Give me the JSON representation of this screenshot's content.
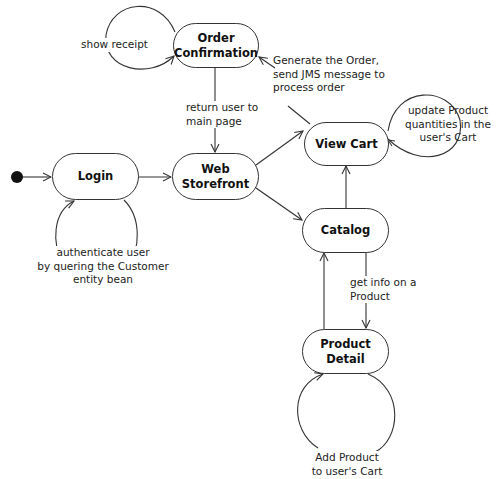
{
  "diagram": {
    "type": "UML state diagram",
    "states": [
      {
        "id": "login",
        "label": "Login"
      },
      {
        "id": "web_storefront",
        "label": "Web\nStorefront"
      },
      {
        "id": "order_confirmation",
        "label": "Order\nConfirmation"
      },
      {
        "id": "view_cart",
        "label": "View Cart"
      },
      {
        "id": "catalog",
        "label": "Catalog"
      },
      {
        "id": "product_detail",
        "label": "Product Detail"
      }
    ],
    "transitions": [
      {
        "from": "initial",
        "to": "login",
        "label": ""
      },
      {
        "from": "login",
        "to": "login",
        "label": "authenticate user\nby quering the Customer\nentity bean"
      },
      {
        "from": "login",
        "to": "web_storefront",
        "label": ""
      },
      {
        "from": "order_confirmation",
        "to": "order_confirmation",
        "label": "show receipt"
      },
      {
        "from": "order_confirmation",
        "to": "web_storefront",
        "label": "return user to\nmain page"
      },
      {
        "from": "view_cart",
        "to": "order_confirmation",
        "label": "Generate the Order,\nsend JMS message to\nprocess order"
      },
      {
        "from": "view_cart",
        "to": "view_cart",
        "label": "update Product\nquantities in the\nuser's Cart"
      },
      {
        "from": "web_storefront",
        "to": "view_cart",
        "label": ""
      },
      {
        "from": "web_storefront",
        "to": "catalog",
        "label": ""
      },
      {
        "from": "catalog",
        "to": "view_cart",
        "label": ""
      },
      {
        "from": "catalog",
        "to": "product_detail",
        "label": "get info on a\nProduct"
      },
      {
        "from": "product_detail",
        "to": "catalog",
        "label": ""
      },
      {
        "from": "product_detail",
        "to": "product_detail",
        "label": "Add Product\nto user's Cart"
      }
    ]
  },
  "states": {
    "login": "Login",
    "web_storefront": "Web\nStorefront",
    "order_confirmation": "Order\nConfirmation",
    "view_cart": "View Cart",
    "catalog": "Catalog",
    "product_detail": "Product Detail"
  },
  "labels": {
    "show_receipt": "show receipt",
    "return_user": "return user to\nmain page",
    "generate_order": "Generate the Order,\nsend JMS message to\nprocess order",
    "update_quantities": "update Product\nquantities in the\nuser's Cart",
    "authenticate": "authenticate user\nby quering the Customer\nentity bean",
    "get_info": "get info on a\nProduct",
    "add_product": "Add Product\nto user's Cart"
  },
  "colors": {
    "line": "#333333",
    "fill": "#ffffff",
    "text": "#111111"
  }
}
